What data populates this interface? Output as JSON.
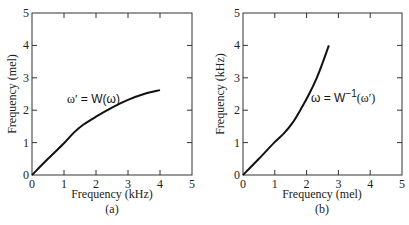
{
  "chart_data": [
    {
      "type": "line",
      "panel_label": "(a)",
      "xlabel": "Frequency (kHz)",
      "ylabel": "Frequency (mel)",
      "xlim": [
        0,
        5
      ],
      "ylim": [
        0,
        5
      ],
      "xticks": [
        "0",
        "1",
        "2",
        "3",
        "4",
        "5"
      ],
      "yticks": [
        "0",
        "1",
        "2",
        "3",
        "4",
        "5"
      ],
      "grid": false,
      "annotation": "ω′ = W(ω)",
      "series": [
        {
          "name": "ω′ = W(ω)",
          "x": [
            0,
            0.5,
            1.0,
            1.3,
            1.6,
            2.0,
            2.5,
            3.0,
            3.5,
            4.0
          ],
          "y": [
            0,
            0.5,
            0.98,
            1.3,
            1.55,
            1.8,
            2.08,
            2.32,
            2.5,
            2.62
          ]
        }
      ]
    },
    {
      "type": "line",
      "panel_label": "(b)",
      "xlabel": "Frequency (mel)",
      "ylabel": "Frequency (kHz)",
      "xlim": [
        0,
        5
      ],
      "ylim": [
        0,
        5
      ],
      "xticks": [
        "0",
        "1",
        "2",
        "3",
        "4",
        "5"
      ],
      "yticks": [
        "0",
        "1",
        "2",
        "3",
        "4",
        "5"
      ],
      "grid": false,
      "annotation": "ω = W⁻¹(ω′)",
      "series": [
        {
          "name": "ω = W⁻¹(ω′)",
          "x": [
            0,
            0.5,
            0.98,
            1.3,
            1.55,
            1.8,
            2.08,
            2.32,
            2.5,
            2.7
          ],
          "y": [
            0,
            0.5,
            1.0,
            1.3,
            1.6,
            2.0,
            2.5,
            3.0,
            3.45,
            4.0
          ]
        }
      ]
    }
  ],
  "panels": {
    "a": {
      "xlabel": "Frequency (kHz)",
      "ylabel": "Frequency (mel)",
      "caption": "(a)",
      "annot_lhs": "ω′",
      "annot_eq": " = W(ω)"
    },
    "b": {
      "xlabel": "Frequency (mel)",
      "ylabel": "Frequency (kHz)",
      "caption": "(b)",
      "annot_lhs": "ω = W",
      "annot_sup": "−1",
      "annot_arg": "(ω′)"
    },
    "ticks": [
      "0",
      "1",
      "2",
      "3",
      "4",
      "5"
    ]
  }
}
